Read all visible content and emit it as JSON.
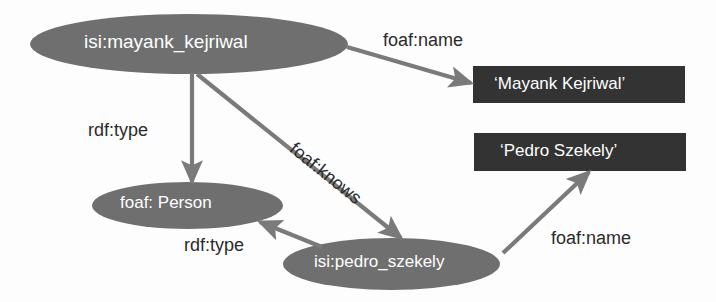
{
  "diagram": {
    "colors": {
      "ellipse_fill": "#6f6f6f",
      "literal_box_fill": "#333333",
      "edge_stroke": "#7a7a7a",
      "node_text": "#ffffff",
      "edge_text": "#2b2b2b",
      "background": "#fdfdfd"
    },
    "nodes": [
      {
        "id": "mayank",
        "kind": "resource-ellipse",
        "label": "isi:mayank_kejriwal",
        "x": 30,
        "y": 14,
        "w": 318,
        "h": 60
      },
      {
        "id": "person",
        "kind": "resource-ellipse",
        "label": "foaf: Person",
        "x": 92,
        "y": 182,
        "w": 191,
        "h": 47
      },
      {
        "id": "pedro",
        "kind": "resource-ellipse",
        "label": "isi:pedro_szekely",
        "x": 283,
        "y": 238,
        "w": 217,
        "h": 52
      },
      {
        "id": "mayank_literal",
        "kind": "literal-box",
        "label": "‘Mayank Kejriwal’",
        "x": 473,
        "y": 66,
        "w": 212,
        "h": 37
      },
      {
        "id": "pedro_literal",
        "kind": "literal-box",
        "label": "‘Pedro Szekely’",
        "x": 474,
        "y": 133,
        "w": 212,
        "h": 38
      }
    ],
    "edges": [
      {
        "id": "mayank-foafname",
        "label": "foaf:name",
        "from": "mayank",
        "to": "mayank_literal"
      },
      {
        "id": "mayank-rdftype",
        "label": "rdf:type",
        "from": "mayank",
        "to": "person"
      },
      {
        "id": "mayank-foafknows",
        "label": "foaf:knows",
        "from": "mayank",
        "to": "pedro"
      },
      {
        "id": "pedro-rdftype",
        "label": "rdf:type",
        "from": "pedro",
        "to": "person"
      },
      {
        "id": "pedro-foafname",
        "label": "foaf:name",
        "from": "pedro",
        "to": "pedro_literal"
      }
    ]
  }
}
